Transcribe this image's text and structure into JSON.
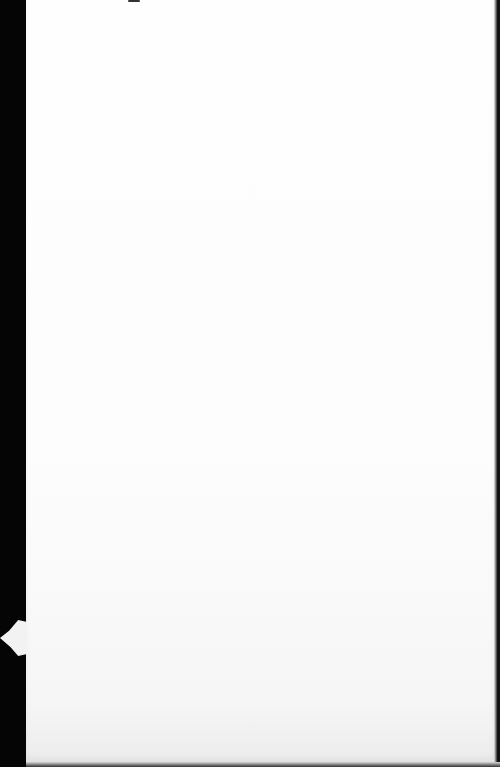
{
  "scene": {
    "description": "Blank white sheet of paper photographed against a dark background",
    "paper_color": "#fdfdfd",
    "background_color": "#000000",
    "text": ""
  }
}
